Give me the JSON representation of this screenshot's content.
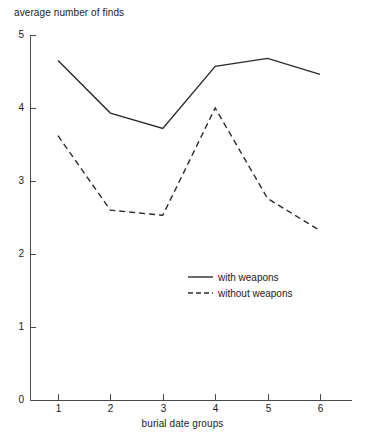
{
  "chart_data": {
    "type": "line",
    "title": "",
    "xlabel": "burial date groups",
    "ylabel": "average number of finds",
    "categories": [
      "1",
      "2",
      "3",
      "4",
      "5",
      "6"
    ],
    "x": [
      1,
      2,
      3,
      4,
      5,
      6
    ],
    "xlim": [
      0.5,
      6.6
    ],
    "ylim": [
      0,
      5
    ],
    "yticks": [
      "0",
      "1",
      "2",
      "3",
      "4",
      "5"
    ],
    "ytick_values": [
      0,
      1,
      2,
      3,
      4,
      5
    ],
    "xticks": [
      "1",
      "2",
      "3",
      "4",
      "5",
      "6"
    ],
    "grid": false,
    "legend_position": "center-right",
    "series": [
      {
        "name": "with weapons",
        "style": "solid",
        "color": "#2b2b2b",
        "values": [
          4.65,
          3.93,
          3.72,
          4.57,
          4.68,
          4.46
        ]
      },
      {
        "name": "without weapons",
        "style": "dashed",
        "color": "#2b2b2b",
        "values": [
          3.62,
          2.6,
          2.53,
          4.0,
          2.76,
          2.32
        ]
      }
    ]
  },
  "legend": {
    "entries": [
      {
        "label": "with weapons",
        "style": "solid"
      },
      {
        "label": "without weapons",
        "style": "dashed"
      }
    ]
  },
  "colors": {
    "axis": "#4a4a4a",
    "line": "#2b2b2b",
    "background": "#ffffff"
  }
}
